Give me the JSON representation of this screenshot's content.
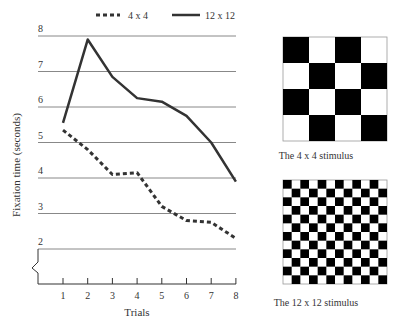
{
  "chart_data": {
    "type": "line",
    "title": "",
    "xlabel": "Trials",
    "ylabel": "Fixation time (seconds)",
    "x": [
      1,
      2,
      3,
      4,
      5,
      6,
      7,
      8
    ],
    "x_ticks": [
      "1",
      "2",
      "3",
      "4",
      "5",
      "6",
      "7",
      "8"
    ],
    "y_ticks": [
      "2",
      "3",
      "4",
      "5",
      "6",
      "7",
      "8"
    ],
    "ylim": [
      1,
      8
    ],
    "y_axis_break": true,
    "grid": "horizontal",
    "legend_position": "top",
    "series": [
      {
        "name": "4 x 4",
        "style": "dashed",
        "values": [
          5.35,
          4.8,
          4.1,
          4.15,
          3.2,
          2.8,
          2.75,
          2.3
        ]
      },
      {
        "name": "12 x 12",
        "style": "solid",
        "values": [
          5.55,
          7.9,
          6.85,
          6.25,
          6.15,
          5.75,
          5.0,
          3.9
        ]
      }
    ]
  },
  "legend": {
    "dashed_label": "4 x 4",
    "solid_label": "12 x 12"
  },
  "stimuli": {
    "small": {
      "caption": "The 4 x 4 stimulus",
      "grid": 4
    },
    "large": {
      "caption": "The 12 x 12 stimulus",
      "grid": 12
    }
  },
  "colors": {
    "line": "#333333",
    "grid": "#888888",
    "black_square": "#000000"
  }
}
